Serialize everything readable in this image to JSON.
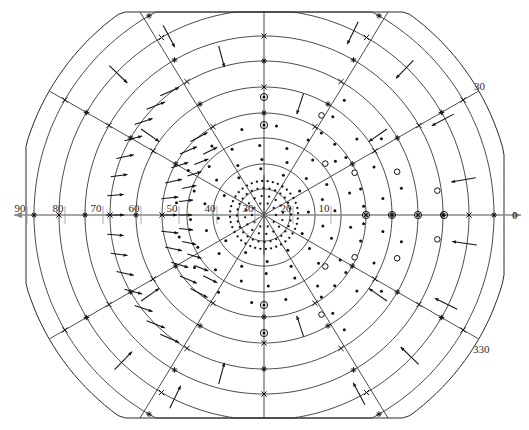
{
  "figure": {
    "title": "",
    "background_color": "#ffffff",
    "line_color": "#2b2b2b",
    "axis_color": "#8a8a8a",
    "marker_color": "#111111"
  },
  "chart_data": {
    "type": "scatter",
    "title": "",
    "xlabel": "",
    "ylabel": "",
    "projection": "polar",
    "grid": true,
    "legend": "none",
    "center_px": [
      264,
      215
    ],
    "px_per_unit": 2.56,
    "radial_axis": {
      "label": "",
      "direction": "left-from-center",
      "ticks": [
        10,
        20,
        30,
        40,
        50,
        60,
        70,
        80,
        90
      ],
      "tick_labels": [
        "10",
        "20",
        "30",
        "40",
        "50",
        "60",
        "70",
        "80",
        "90"
      ],
      "tick_px_x": [
        226,
        188,
        150,
        112,
        74,
        36,
        -2,
        -40,
        -78
      ],
      "range": [
        0,
        95
      ]
    },
    "angular_axis": {
      "labels": [
        "0",
        "30",
        "330"
      ],
      "label_px": [
        [
          512,
          215
        ],
        [
          474,
          86
        ],
        [
          473,
          349
        ]
      ],
      "spoke_angles_deg": [
        0,
        30,
        60,
        90,
        120,
        150,
        180,
        210,
        240,
        270,
        300,
        330
      ]
    },
    "rings": {
      "radii_units": [
        10,
        20,
        30,
        40,
        50,
        60,
        70,
        80,
        90
      ],
      "radii_px": [
        26,
        51,
        77,
        102,
        128,
        154,
        179,
        205,
        230
      ],
      "outer_boundary": "clipped-polygon"
    },
    "center_cluster": {
      "description": "dense dotted concentric rings near origin",
      "ring_radii_px": [
        12,
        19,
        27,
        34
      ],
      "dot_counts": [
        10,
        16,
        28,
        40
      ]
    },
    "series": [
      {
        "name": "vector-arrows",
        "marker": "arrow",
        "description": "displacement vectors drawn at sample nodes",
        "count": 74
      },
      {
        "name": "cross-markers",
        "marker": "x",
        "label_glyph": "x",
        "count": 12
      },
      {
        "name": "star-markers",
        "marker": "*",
        "label_glyph": "*",
        "count": 10
      },
      {
        "name": "circled-dot-markers",
        "marker": "circled-dot",
        "count": 9
      },
      {
        "name": "open-circle-markers",
        "marker": "open-circle",
        "count": 10
      },
      {
        "name": "filled-dot-markers",
        "marker": "dot",
        "count": 120
      }
    ]
  },
  "labels": {
    "radial": [
      "90",
      "80",
      "70",
      "60",
      "50",
      "40",
      "30",
      "20",
      "10"
    ],
    "angular_right": "0",
    "angular_upper_right": "30",
    "angular_lower_right": "330"
  }
}
